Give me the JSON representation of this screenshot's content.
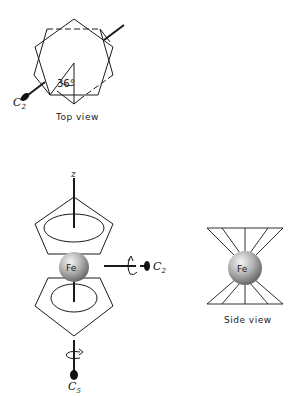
{
  "figure": {
    "top_view": {
      "caption": "Top view",
      "angle_label": "36°",
      "axis_label": "C",
      "axis_sub": "2"
    },
    "sandwich_view": {
      "z_label": "z",
      "metal_label": "Fe",
      "c2_label": "C",
      "c2_sub": "2",
      "c5_label": "C",
      "c5_sub": "5"
    },
    "side_view": {
      "caption": "Side view",
      "metal_label": "Fe"
    },
    "colors": {
      "line": "#1a1a1a",
      "sphere_light": "#f2f2f2",
      "sphere_dark": "#6e6e6e"
    }
  }
}
